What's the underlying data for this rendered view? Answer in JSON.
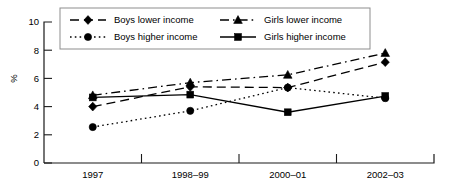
{
  "chart_data": {
    "type": "line",
    "title": "",
    "xlabel": "",
    "ylabel": "%",
    "categories": [
      "1997",
      "1998–99",
      "2000–01",
      "2002–03"
    ],
    "ylim": [
      0,
      10
    ],
    "yticks": [
      0,
      2,
      4,
      6,
      8,
      10
    ],
    "ytick_labels": [
      "0",
      "2",
      "4",
      "6",
      "8",
      "10"
    ],
    "grid": false,
    "legend_position": "top",
    "series": [
      {
        "name": "Boys lower income",
        "values": [
          4.0,
          5.4,
          5.35,
          7.15
        ],
        "marker": "diamond",
        "line_style": "dashed",
        "color": "#000000"
      },
      {
        "name": "Girls lower income",
        "values": [
          4.8,
          5.7,
          6.25,
          7.8
        ],
        "marker": "triangle",
        "line_style": "dash-dot",
        "color": "#000000"
      },
      {
        "name": "Boys higher income",
        "values": [
          2.55,
          3.7,
          5.35,
          4.6
        ],
        "marker": "circle",
        "line_style": "dotted",
        "color": "#000000"
      },
      {
        "name": "Girls higher income",
        "values": [
          4.65,
          4.85,
          3.6,
          4.75
        ],
        "marker": "square",
        "line_style": "solid",
        "color": "#000000"
      }
    ]
  },
  "axes": {
    "y_title": "%",
    "y_tick_labels": [
      "10",
      "8",
      "6",
      "4",
      "2",
      "0"
    ],
    "x_tick_labels": [
      "1997",
      "1998–99",
      "2000–01",
      "2002–03"
    ]
  },
  "legend": {
    "entries": [
      {
        "label": "Boys lower income",
        "marker": "diamond",
        "line_style": "dashed"
      },
      {
        "label": "Girls lower income",
        "marker": "triangle",
        "line_style": "dash-dot"
      },
      {
        "label": "Boys higher income",
        "marker": "circle",
        "line_style": "dotted"
      },
      {
        "label": "Girls higher income",
        "marker": "square",
        "line_style": "solid"
      }
    ]
  }
}
